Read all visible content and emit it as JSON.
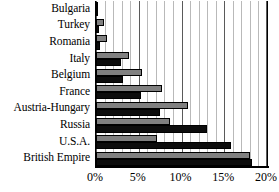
{
  "chart_data": {
    "type": "bar",
    "orientation": "horizontal",
    "title": "",
    "subtitle": "",
    "xlabel": "",
    "ylabel": "",
    "xlim": [
      0,
      20
    ],
    "xtick_labels": [
      "0%",
      "5%",
      "10%",
      "15%",
      "20%"
    ],
    "xtick_values": [
      0,
      5,
      10,
      15,
      20
    ],
    "xtick_suffix": "%",
    "grid": true,
    "grid_minor_step": 1,
    "grid_major_step": 5,
    "legend": false,
    "legend_position": "none",
    "categories": [
      "Bulgaria",
      "Turkey",
      "Romania",
      "Italy",
      "Belgium",
      "France",
      "Austria-Hungary",
      "Russia",
      "U.S.A.",
      "British Empire"
    ],
    "series": [
      {
        "name": "series-a",
        "color": "#808080",
        "values": [
          0.25,
          0.9,
          1.3,
          3.9,
          5.4,
          7.7,
          10.8,
          8.7,
          7.1,
          18.0
        ]
      },
      {
        "name": "series-b",
        "color": "#0d0d0d",
        "values": [
          0.2,
          0.4,
          0.5,
          2.9,
          3.1,
          5.3,
          7.5,
          13.0,
          15.8,
          18.2
        ]
      }
    ]
  },
  "colors": {
    "series_a": "#808080",
    "series_b": "#0d0d0d",
    "axis": "#000000",
    "gridline_minor": "#b9b9b9",
    "gridline_major": "#5a5a5a",
    "background": "#ffffff"
  }
}
